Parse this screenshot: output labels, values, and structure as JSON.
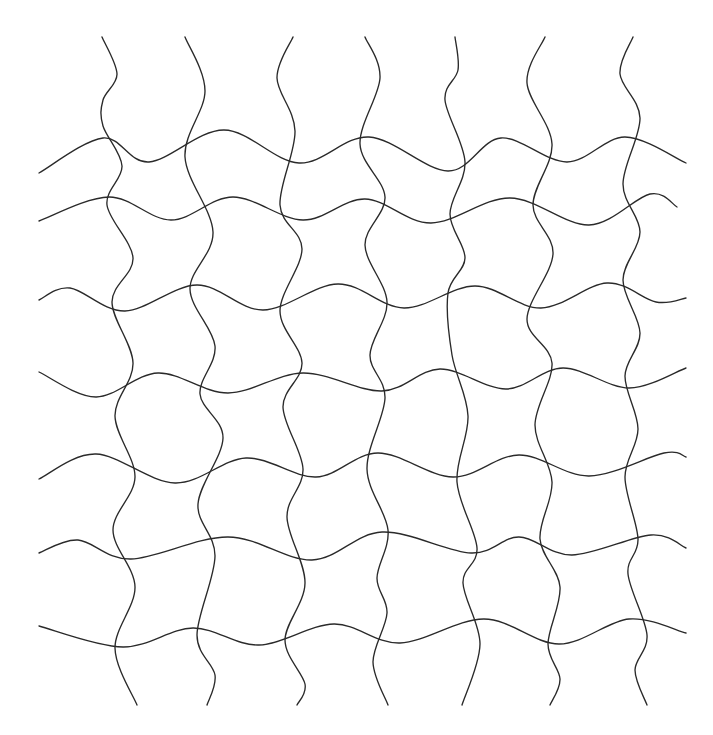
{
  "figure": {
    "stroke_color": "#2a2a2a",
    "background_color": "#ffffff",
    "vertical_curve_count": 7,
    "horizontal_curve_count": 7,
    "vertical_curves": [
      {
        "id": "v1",
        "label": "vertical-curve-1"
      },
      {
        "id": "v2",
        "label": "vertical-curve-2"
      },
      {
        "id": "v3",
        "label": "vertical-curve-3"
      },
      {
        "id": "v4",
        "label": "vertical-curve-4"
      },
      {
        "id": "v5",
        "label": "vertical-curve-5"
      },
      {
        "id": "v6",
        "label": "vertical-curve-6"
      },
      {
        "id": "v7",
        "label": "vertical-curve-7"
      }
    ],
    "horizontal_curves": [
      {
        "id": "h1",
        "label": "horizontal-curve-1"
      },
      {
        "id": "h2",
        "label": "horizontal-curve-2"
      },
      {
        "id": "h3",
        "label": "horizontal-curve-3"
      },
      {
        "id": "h4",
        "label": "horizontal-curve-4"
      },
      {
        "id": "h5",
        "label": "horizontal-curve-5"
      },
      {
        "id": "h6",
        "label": "horizontal-curve-6"
      },
      {
        "id": "h7",
        "label": "horizontal-curve-7"
      }
    ]
  }
}
